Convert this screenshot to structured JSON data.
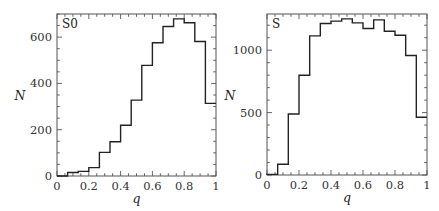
{
  "chart_data": [
    {
      "type": "bar",
      "title": "S0",
      "panel_label": "S0",
      "xlabel": "q",
      "ylabel": "N",
      "xlim": [
        0,
        1
      ],
      "ylim": [
        0,
        700
      ],
      "grid": false,
      "histogram": true,
      "bin_edges": [
        0,
        0.0667,
        0.1333,
        0.2,
        0.2667,
        0.3333,
        0.4,
        0.4667,
        0.5333,
        0.6,
        0.6667,
        0.7333,
        0.8,
        0.8667,
        0.9333,
        1.0
      ],
      "categories": [
        "0.03",
        "0.10",
        "0.17",
        "0.23",
        "0.30",
        "0.37",
        "0.43",
        "0.50",
        "0.57",
        "0.63",
        "0.70",
        "0.77",
        "0.83",
        "0.90",
        "0.97"
      ],
      "values": [
        0,
        15,
        20,
        36,
        102,
        148,
        219,
        328,
        478,
        576,
        646,
        679,
        662,
        581,
        314
      ],
      "xticks": [
        "0",
        "0.2",
        "0.4",
        "0.6",
        "0.8",
        "1"
      ],
      "yticks": [
        "0",
        "200",
        "400",
        "600"
      ],
      "y_major": [
        0,
        200,
        400,
        600
      ],
      "y_minor_step": 50
    },
    {
      "type": "bar",
      "title": "S",
      "panel_label": "S",
      "xlabel": "q",
      "ylabel": "N",
      "xlim": [
        0,
        1
      ],
      "ylim": [
        0,
        1290
      ],
      "grid": false,
      "histogram": true,
      "bin_edges": [
        0,
        0.0667,
        0.1333,
        0.2,
        0.2667,
        0.3333,
        0.4,
        0.4667,
        0.5333,
        0.6,
        0.6667,
        0.7333,
        0.8,
        0.8667,
        0.9333,
        1.0
      ],
      "categories": [
        "0.03",
        "0.10",
        "0.17",
        "0.23",
        "0.30",
        "0.37",
        "0.43",
        "0.50",
        "0.57",
        "0.63",
        "0.70",
        "0.77",
        "0.83",
        "0.90",
        "0.97"
      ],
      "values": [
        5,
        86,
        489,
        799,
        1115,
        1214,
        1233,
        1251,
        1219,
        1174,
        1243,
        1152,
        1120,
        957,
        463
      ],
      "xticks": [
        "0",
        "0.2",
        "0.4",
        "0.6",
        "0.8",
        "1"
      ],
      "yticks": [
        "0",
        "500",
        "1000"
      ],
      "y_major": [
        0,
        500,
        1000
      ],
      "y_minor_step": 100
    }
  ]
}
